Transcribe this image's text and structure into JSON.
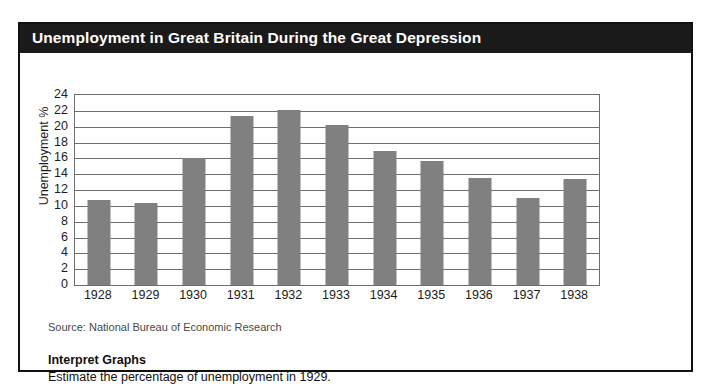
{
  "panel": {
    "title": "Unemployment in Great Britain During the Great Depression"
  },
  "captions": {
    "source": "Source: National Bureau of Economic Research",
    "activity_heading": "Interpret Graphs",
    "activity_question": "Estimate the percentage of unemployment in 1929."
  },
  "colors": {
    "bar_fill": "#808080",
    "title_band": "#1a1a1a",
    "title_text": "#ffffff",
    "grid": "#6e6e6e",
    "frame": "#111111"
  },
  "chart_data": {
    "type": "bar",
    "title": "Unemployment in Great Britain During the Great Depression",
    "xlabel": "",
    "ylabel": "Unemployment %",
    "ylim": [
      0,
      24
    ],
    "ytick_step": 2,
    "yticks": [
      24,
      22,
      20,
      18,
      16,
      14,
      12,
      10,
      8,
      6,
      4,
      2,
      0
    ],
    "grid": true,
    "legend": false,
    "categories": [
      "1928",
      "1929",
      "1930",
      "1931",
      "1932",
      "1933",
      "1934",
      "1935",
      "1936",
      "1937",
      "1938"
    ],
    "values": [
      10.7,
      10.4,
      16.0,
      21.3,
      22.1,
      20.2,
      16.9,
      15.7,
      13.5,
      11.0,
      13.4
    ],
    "source": "Source: National Bureau of Economic Research"
  }
}
